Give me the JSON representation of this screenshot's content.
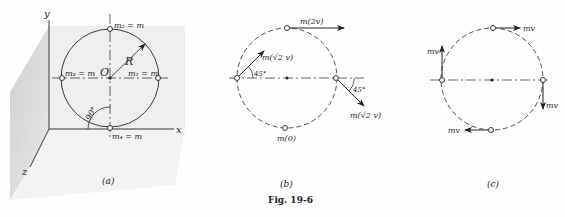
{
  "figure": {
    "caption": "Fig. 19-6",
    "panels": [
      {
        "id": "a",
        "label": "(a)",
        "axes": {
          "x": "x",
          "y": "y",
          "z": "z"
        },
        "origin_label": "O",
        "radius_label": "R",
        "angle_label": "90°",
        "masses": [
          {
            "label": "m₁ = m",
            "position": "right"
          },
          {
            "label": "m₂ = m",
            "position": "top"
          },
          {
            "label": "m₃ = m",
            "position": "left"
          },
          {
            "label": "m₄ = m",
            "position": "bottom"
          }
        ]
      },
      {
        "id": "b",
        "label": "(b)",
        "vectors": [
          {
            "label": "m(2v)",
            "position": "top",
            "direction": "right"
          },
          {
            "label": "m(√2 v)",
            "position": "left",
            "direction": "up-right 45°"
          },
          {
            "label": "m(√2 v)",
            "position": "right",
            "direction": "down-right 45°"
          },
          {
            "label": "m(0)",
            "position": "bottom",
            "direction": "none"
          }
        ],
        "angle_left": "45°",
        "angle_right": "45°"
      },
      {
        "id": "c",
        "label": "(c)",
        "vectors": [
          {
            "label": "mv",
            "position": "top",
            "direction": "right"
          },
          {
            "label": "mv",
            "position": "left",
            "direction": "up"
          },
          {
            "label": "mv",
            "position": "right",
            "direction": "down"
          },
          {
            "label": "mv",
            "position": "bottom",
            "direction": "left"
          }
        ]
      }
    ]
  },
  "text": {
    "a_label": "(a)",
    "b_label": "(b)",
    "c_label": "(c)",
    "caption": "Fig. 19-6",
    "x_axis": "x",
    "y_axis": "y",
    "z_axis": "z",
    "origin": "O",
    "radius": "R",
    "angle90": "90°",
    "m1": "m₁ = m",
    "m2": "m₂ = m",
    "m3": "m₃ = m",
    "m4": "m₄ = m",
    "b_top": "m(2v)",
    "b_left": "m(√2 v)",
    "b_right": "m(√2 v)",
    "b_bottom": "m(0)",
    "b_angle_left": "45°",
    "b_angle_right": "45°",
    "c_top": "mv",
    "c_left": "mv",
    "c_right": "mv",
    "c_bottom": "mv"
  }
}
